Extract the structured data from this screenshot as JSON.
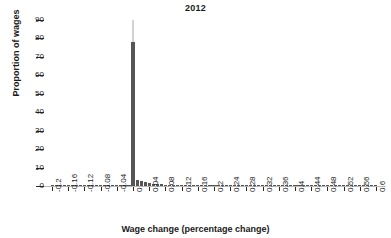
{
  "chart_data": {
    "type": "bar",
    "title": "2012",
    "xlabel": "Wage change (percentage change)",
    "ylabel": "Proportion of wages",
    "grid": false,
    "legend": null,
    "xlim": [
      -0.22,
      0.62
    ],
    "ylim": [
      0,
      90
    ],
    "y_ticks": [
      0,
      10,
      20,
      30,
      40,
      50,
      60,
      70,
      80,
      90
    ],
    "x_ticks": [
      -0.2,
      -0.16,
      -0.12,
      -0.08,
      -0.04,
      0,
      0.04,
      0.08,
      0.12,
      0.16,
      0.2,
      0.24,
      0.28,
      0.32,
      0.36,
      0.4,
      0.44,
      0.48,
      0.52,
      0.56,
      0.6
    ],
    "x_tick_labels": [
      "-0.2",
      "-0.16",
      "-0.12",
      "-0.08",
      "-0.04",
      "0",
      "0.04",
      "0.08",
      "0.12",
      "0.16",
      "0.2",
      "0.24",
      "0.28",
      "0.32",
      "0.36",
      "0.4",
      "0.44",
      "0.48",
      "0.52",
      "0.56",
      "0.6"
    ],
    "bar_color": "#565656",
    "overflow_color": "#d2d2d2",
    "overflow_marker": {
      "x": 0.0,
      "value": 90,
      "note": "thin light grey line above the zero spike reaching the top of the axis"
    },
    "x": [
      -0.2,
      -0.19,
      -0.18,
      -0.17,
      -0.16,
      -0.15,
      -0.14,
      -0.13,
      -0.12,
      -0.11,
      -0.1,
      -0.09,
      -0.08,
      -0.07,
      -0.06,
      -0.05,
      -0.04,
      -0.03,
      -0.02,
      -0.01,
      0.0,
      0.01,
      0.02,
      0.03,
      0.04,
      0.05,
      0.06,
      0.07,
      0.08,
      0.09,
      0.1,
      0.11,
      0.12,
      0.13,
      0.14,
      0.15,
      0.16,
      0.17,
      0.18,
      0.19,
      0.2,
      0.21,
      0.22,
      0.23,
      0.24,
      0.25,
      0.26,
      0.27,
      0.28,
      0.29,
      0.3,
      0.31,
      0.32,
      0.33,
      0.34,
      0.35,
      0.36,
      0.37,
      0.38,
      0.39,
      0.4,
      0.41,
      0.42,
      0.43,
      0.44,
      0.45,
      0.46,
      0.47,
      0.48,
      0.49,
      0.5,
      0.51,
      0.52,
      0.53,
      0.54,
      0.55,
      0.56,
      0.57,
      0.58,
      0.59,
      0.6
    ],
    "values": [
      0.6,
      0.1,
      0.1,
      0.1,
      0.15,
      0.1,
      0.1,
      0.1,
      0.15,
      0.1,
      0.1,
      0.1,
      0.2,
      0.15,
      0.15,
      0.2,
      0.3,
      0.3,
      0.4,
      0.6,
      78.0,
      3.0,
      2.6,
      2.0,
      1.5,
      1.2,
      1.0,
      0.9,
      0.8,
      0.7,
      0.6,
      0.55,
      0.5,
      0.45,
      0.4,
      0.38,
      0.35,
      0.32,
      0.3,
      0.28,
      0.26,
      0.24,
      0.22,
      0.2,
      0.2,
      0.18,
      0.17,
      0.16,
      0.15,
      0.14,
      0.13,
      0.12,
      0.12,
      0.11,
      0.1,
      0.1,
      0.1,
      0.09,
      0.09,
      0.08,
      0.08,
      0.08,
      0.07,
      0.07,
      0.07,
      0.06,
      0.06,
      0.06,
      0.05,
      0.05,
      0.05,
      0.05,
      0.04,
      0.04,
      0.04,
      0.04,
      0.03,
      0.03,
      0.03,
      0.03,
      0.03
    ]
  }
}
